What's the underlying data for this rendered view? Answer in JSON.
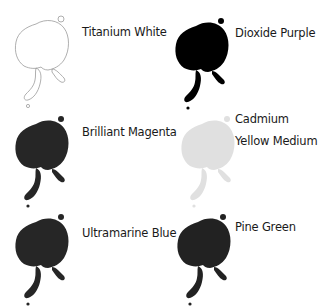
{
  "swatches": [
    {
      "name": "Titanium White",
      "lines": [
        "Titanium White"
      ],
      "fill": "none",
      "stroke": "#9a9a9a",
      "style": "outline"
    },
    {
      "name": "Dioxide Purple",
      "lines": [
        "Dioxide Purple"
      ],
      "fill": "#000000",
      "stroke": "none",
      "style": "solid"
    },
    {
      "name": "Brilliant Magenta",
      "lines": [
        "Brilliant Magenta"
      ],
      "fill": "#262626",
      "stroke": "none",
      "style": "solid"
    },
    {
      "name": "Cadmium Yellow Medium",
      "lines": [
        "Cadmium",
        "Yellow Medium"
      ],
      "fill": "#e0e0e0",
      "stroke": "none",
      "style": "solid"
    },
    {
      "name": "Ultramarine Blue",
      "lines": [
        "Ultramarine Blue"
      ],
      "fill": "#262626",
      "stroke": "none",
      "style": "solid"
    },
    {
      "name": "Pine Green",
      "lines": [
        "Pine Green"
      ],
      "fill": "#222222",
      "stroke": "none",
      "style": "solid"
    }
  ]
}
